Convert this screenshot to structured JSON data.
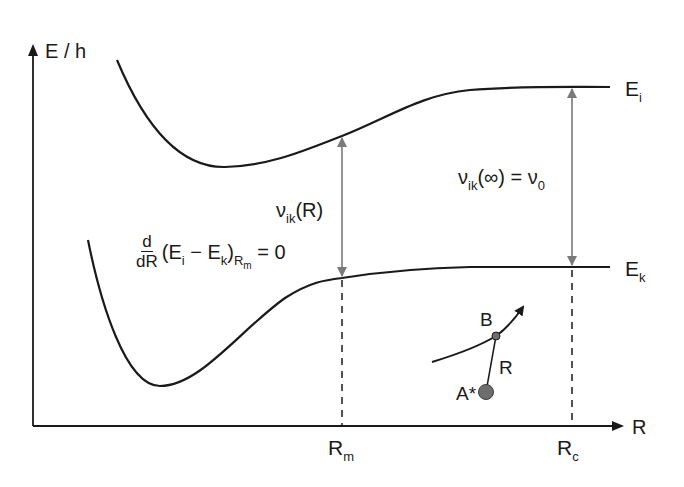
{
  "diagram": {
    "type": "potential-energy-curves",
    "axes": {
      "y_label": "E / h",
      "x_label": "R"
    },
    "curves": [
      {
        "name": "upper-state",
        "label": "E",
        "label_sub": "i"
      },
      {
        "name": "lower-state",
        "label": "E",
        "label_sub": "k"
      }
    ],
    "markers": {
      "rm": {
        "label": "R",
        "sub": "m"
      },
      "rc": {
        "label": "R",
        "sub": "c"
      }
    },
    "annotations": {
      "nu_R": {
        "sym": "ν",
        "sub": "ik",
        "arg": "(R)"
      },
      "nu_inf": {
        "sym": "ν",
        "sub": "ik",
        "arg": "(∞) = ν",
        "sub2": "0"
      },
      "derivative": {
        "num": "d",
        "den": "dR",
        "body_open": "(E",
        "sub_i": "i",
        "minus": " − E",
        "sub_k": "k",
        "close": ")",
        "sub_rm_R": "R",
        "sub_rm_m": "m",
        "equals": " = 0"
      }
    },
    "inset": {
      "atom_a": "A*",
      "atom_b": "B",
      "distance": "R"
    },
    "colors": {
      "line": "#1a1a1a",
      "arrow": "#7a7a7a",
      "atom": "#6e6e6e"
    }
  }
}
